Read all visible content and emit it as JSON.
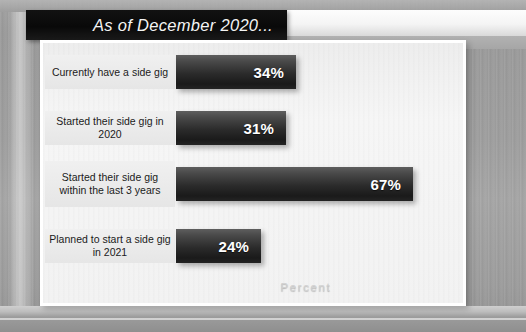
{
  "header": {
    "title": "As of December 2020..."
  },
  "chart_data": {
    "type": "bar",
    "orientation": "horizontal",
    "title": "As of December 2020...",
    "xlabel": "Percent",
    "ylabel": "",
    "categories": [
      "Currently have a side gig",
      "Started their side gig in 2020",
      "Started their side gig within the last 3 years",
      "Planned to start a side gig in 2021"
    ],
    "values": [
      34,
      31,
      67,
      24
    ],
    "value_labels": [
      "34%",
      "31%",
      "67%",
      "24%"
    ],
    "xlim": [
      0,
      80
    ],
    "grid": false,
    "legend": "none",
    "colors": {
      "bar": "#2b2b2b",
      "bar_highlight": "#5e5e5e",
      "value_text": "#ffffff",
      "plot_background": "#f2f2f2",
      "frame_border": "#ffffff",
      "category_label_background": "#ebebeb",
      "category_label_text": "#1b1b1b",
      "axis_title": "#d0d0d0",
      "title_bar_background": "#0d0d0d",
      "title_text": "#f4f4f4",
      "page_background": "#9d9d9d"
    }
  }
}
